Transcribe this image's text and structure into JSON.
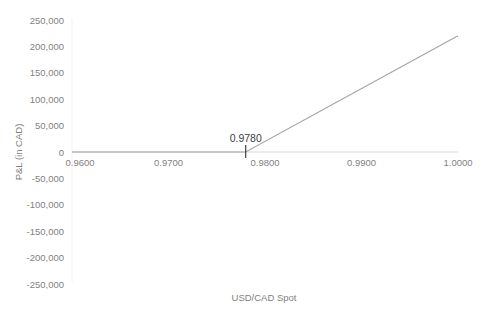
{
  "chart_data": {
    "type": "line",
    "title": "",
    "xlabel": "USD/CAD Spot",
    "ylabel": "P&L (in CAD)",
    "x": [
      0.96,
      0.978,
      1.0
    ],
    "series": [
      {
        "name": "P&L",
        "values": [
          0,
          0,
          220000
        ],
        "color": "#a6a6a6"
      }
    ],
    "xlim": [
      0.96,
      1.0
    ],
    "ylim": [
      -250000,
      250000
    ],
    "x_ticks": [
      "0.9600",
      "0.9700",
      "0.9800",
      "0.9900",
      "1.0000"
    ],
    "y_ticks": [
      "250,000",
      "200,000",
      "150,000",
      "100,000",
      "50,000",
      "0",
      "-50,000",
      "-100,000",
      "-150,000",
      "-200,000",
      "-250,000"
    ],
    "annotations": [
      {
        "text": "0.9780",
        "x": 0.978,
        "y": 0,
        "marker": "vertical-tick"
      }
    ],
    "grid": false,
    "legend": "none"
  }
}
